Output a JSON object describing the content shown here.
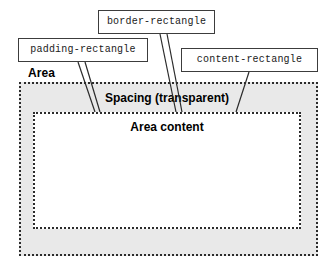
{
  "figure": {
    "width": 334,
    "height": 272
  },
  "callouts": [
    {
      "id": "border-rectangle",
      "label": "border-rectangle",
      "box": {
        "x": 98,
        "y": 10,
        "w": 117,
        "h": 24
      }
    },
    {
      "id": "padding-rectangle",
      "label": "padding-rectangle",
      "box": {
        "x": 18,
        "y": 38,
        "w": 130,
        "h": 24
      }
    },
    {
      "id": "content-rectangle",
      "label": "content-rectangle",
      "box": {
        "x": 181,
        "y": 48,
        "w": 137,
        "h": 24
      }
    }
  ],
  "diagram": {
    "area_label": "Area",
    "spacing_label": "Spacing (transparent)",
    "content_label": "Area content",
    "spacing_rect": {
      "x": 19,
      "y": 82,
      "w": 299,
      "h": 174
    },
    "content_rect": {
      "x": 33,
      "y": 112,
      "w": 268,
      "h": 117
    }
  },
  "colors": {
    "page_background": "#ffffff",
    "spacing_fill": "#e9e9e9",
    "content_fill": "#ffffff",
    "dotted_border": "#2b2b2b",
    "callout_border": "#3c3c3c",
    "text": "#000000",
    "leader_line": "#2b2b2b"
  },
  "leader_lines": [
    {
      "name": "padding-leader-a",
      "x1": 78,
      "y1": 62,
      "x2": 95,
      "y2": 112
    },
    {
      "name": "padding-leader-b",
      "x1": 85,
      "y1": 62,
      "x2": 100,
      "y2": 112
    },
    {
      "name": "border-leader-a",
      "x1": 160,
      "y1": 34,
      "x2": 176,
      "y2": 112
    },
    {
      "name": "border-leader-b",
      "x1": 167,
      "y1": 34,
      "x2": 182,
      "y2": 112
    },
    {
      "name": "content-leader-a",
      "x1": 249,
      "y1": 72,
      "x2": 236,
      "y2": 112
    }
  ]
}
